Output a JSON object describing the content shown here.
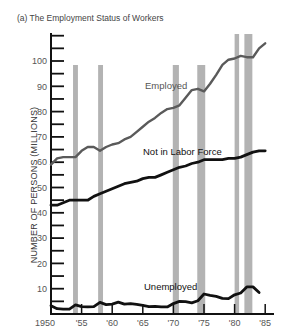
{
  "chart_data": {
    "type": "line",
    "title": "(a) The Employment Status of Workers",
    "xlabel": "",
    "ylabel": "NUMBER OF PERSONS (MILLIONS)",
    "x_tick_labels": [
      "1950",
      "'55",
      "'60",
      "'65",
      "'70",
      "'75",
      "'80",
      "'85"
    ],
    "x_ticks": [
      1950,
      1955,
      1960,
      1965,
      1970,
      1975,
      1980,
      1985
    ],
    "y_tick_labels": [
      "10",
      "20",
      "30",
      "40",
      "50",
      "60",
      "70",
      "80",
      "90",
      "100"
    ],
    "y_ticks": [
      10,
      20,
      30,
      40,
      50,
      60,
      70,
      80,
      90,
      100
    ],
    "ylim": [
      0,
      110
    ],
    "xlim": [
      1950,
      1987
    ],
    "grid": false,
    "legend": "inline labels",
    "recession_shading": [
      {
        "start": 1953.6,
        "end": 1954.4
      },
      {
        "start": 1957.7,
        "end": 1958.5
      },
      {
        "start": 1969.9,
        "end": 1970.9
      },
      {
        "start": 1973.9,
        "end": 1975.2
      },
      {
        "start": 1980.0,
        "end": 1980.6
      },
      {
        "start": 1981.6,
        "end": 1982.9
      }
    ],
    "series": [
      {
        "name": "Employed",
        "color": "#5a5a5a",
        "x": [
          1950,
          1951,
          1952,
          1953,
          1954,
          1955,
          1956,
          1957,
          1958,
          1959,
          1960,
          1961,
          1962,
          1963,
          1964,
          1965,
          1966,
          1967,
          1968,
          1969,
          1970,
          1971,
          1972,
          1973,
          1974,
          1975,
          1976,
          1977,
          1978,
          1979,
          1980,
          1981,
          1982,
          1983,
          1984,
          1985
        ],
        "values": [
          59,
          61.5,
          62,
          62,
          62,
          64.5,
          66,
          66,
          64.5,
          66,
          67,
          67.5,
          69,
          70,
          72,
          74,
          76,
          77.5,
          79.5,
          81,
          81.5,
          82.5,
          85.5,
          88.5,
          89,
          88,
          91,
          94.5,
          98.5,
          100.5,
          101,
          102,
          101.5,
          101.5,
          105,
          107
        ]
      },
      {
        "name": "Not in Labor Force",
        "color": "#111111",
        "x": [
          1950,
          1951,
          1952,
          1953,
          1954,
          1955,
          1956,
          1957,
          1958,
          1959,
          1960,
          1961,
          1962,
          1963,
          1964,
          1965,
          1966,
          1967,
          1968,
          1969,
          1970,
          1971,
          1972,
          1973,
          1974,
          1975,
          1976,
          1977,
          1978,
          1979,
          1980,
          1981,
          1982,
          1983,
          1984,
          1985
        ],
        "values": [
          43,
          43,
          44,
          45,
          45,
          45,
          45,
          46.5,
          47.5,
          48.5,
          49.5,
          50.5,
          51.5,
          52,
          52.5,
          53.5,
          54,
          54,
          55,
          56,
          57,
          58,
          58.5,
          59.5,
          60,
          61,
          61,
          61,
          61,
          61.5,
          61.5,
          62,
          63,
          64,
          64.5,
          64.5
        ]
      },
      {
        "name": "Unemployed",
        "color": "#111111",
        "x": [
          1950,
          1951,
          1952,
          1953,
          1954,
          1955,
          1956,
          1957,
          1958,
          1959,
          1960,
          1961,
          1962,
          1963,
          1964,
          1965,
          1966,
          1967,
          1968,
          1969,
          1970,
          1971,
          1972,
          1973,
          1974,
          1975,
          1976,
          1977,
          1978,
          1979,
          1980,
          1981,
          1982,
          1983,
          1984
        ],
        "values": [
          3.3,
          2.1,
          1.9,
          1.9,
          3.6,
          2.9,
          2.8,
          2.9,
          4.6,
          3.7,
          3.9,
          4.7,
          3.9,
          4.1,
          3.8,
          3.4,
          2.9,
          3.0,
          2.8,
          2.8,
          4.1,
          5.0,
          4.9,
          4.4,
          5.2,
          7.9,
          7.4,
          7.0,
          6.2,
          6.1,
          7.6,
          8.3,
          10.7,
          10.7,
          8.5
        ]
      }
    ],
    "annotations": [
      {
        "text": "Employed",
        "near_year": 1966,
        "near_value": 90
      },
      {
        "text": "Not in Labor Force",
        "near_year": 1965,
        "near_value": 64
      },
      {
        "text": "Unemployed",
        "near_year": 1965,
        "near_value": 11
      }
    ]
  }
}
